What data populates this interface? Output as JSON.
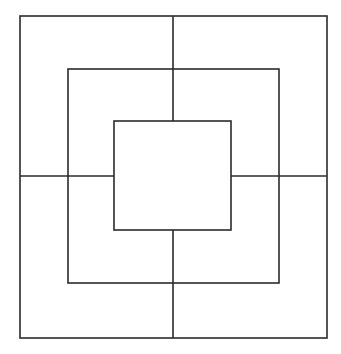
{
  "figure": {
    "canvas": {
      "width": 341,
      "height": 354,
      "background_color": "#ffffff"
    },
    "style": {
      "stroke_color": "#2b2b2b",
      "stroke_width": 1.6,
      "fill": "none",
      "line_cap": "butt"
    },
    "shapes": [
      {
        "name": "outer-square",
        "label": "Outer square",
        "type": "rect",
        "x": 20,
        "y": 16,
        "width": 307,
        "height": 322,
        "left": 20,
        "top": 16,
        "right": 327,
        "bottom": 338
      },
      {
        "name": "middle-square",
        "label": "Middle square",
        "type": "rect",
        "x": 68,
        "y": 69,
        "width": 211,
        "height": 214,
        "left": 68,
        "top": 69,
        "right": 279,
        "bottom": 283
      },
      {
        "name": "inner-square",
        "label": "Inner square",
        "type": "rect",
        "x": 114,
        "y": 121,
        "width": 117,
        "height": 109,
        "left": 114,
        "top": 121,
        "right": 231,
        "bottom": 230
      }
    ],
    "lines": [
      {
        "name": "vertical-line-upper",
        "label": "Vertical line, upper segment",
        "type": "line",
        "x1": 173,
        "y1": 16,
        "x2": 173,
        "y2": 121
      },
      {
        "name": "vertical-line-lower",
        "label": "Vertical line, lower segment",
        "type": "line",
        "x1": 173,
        "y1": 230,
        "x2": 173,
        "y2": 338
      },
      {
        "name": "horizontal-line-left",
        "label": "Horizontal line, left segment",
        "type": "line",
        "x1": 20,
        "y1": 176,
        "x2": 114,
        "y2": 176
      },
      {
        "name": "horizontal-line-right",
        "label": "Horizontal line, right segment",
        "type": "line",
        "x1": 231,
        "y1": 176,
        "x2": 327,
        "y2": 176
      }
    ]
  }
}
